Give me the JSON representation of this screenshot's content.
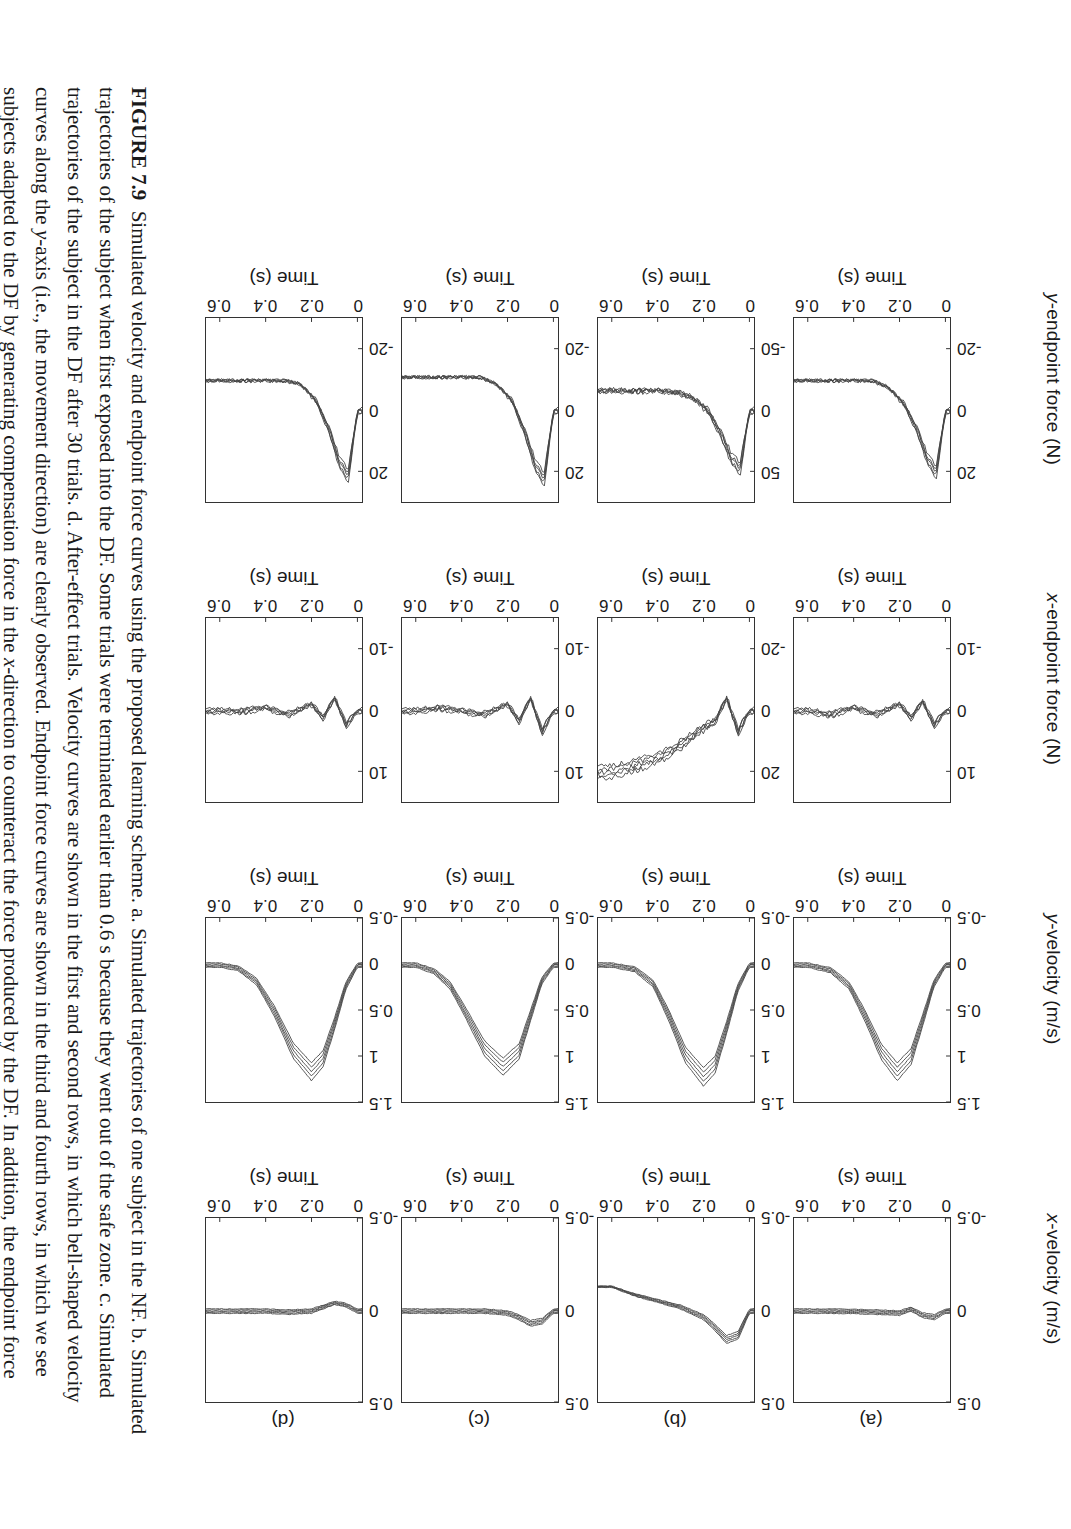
{
  "figure": {
    "id": "FIGURE 7.9",
    "panel_labels": [
      "(a)",
      "(b)",
      "(c)",
      "(d)"
    ],
    "x_axis": {
      "title": "Time (s)",
      "ticks": [
        "0",
        "0.2",
        "0.4",
        "0.6"
      ],
      "tickvals": [
        0,
        0.2,
        0.4,
        0.6
      ],
      "range": [
        -0.02,
        0.66
      ]
    },
    "rows": [
      {
        "title": "x-velocity (m/s)",
        "title_italic_prefix": "x",
        "title_rest": "-velocity (m/s)",
        "yticks": [
          "0.5",
          "0",
          "-0.5"
        ],
        "ytickvals": [
          0.5,
          0,
          -0.5
        ],
        "ylim": [
          -0.5,
          0.5
        ]
      },
      {
        "title": "y-velocity (m/s)",
        "title_italic_prefix": "y",
        "title_rest": "-velocity (m/s)",
        "yticks": [
          "1.5",
          "1",
          "0.5",
          "0",
          "-0.5"
        ],
        "ytickvals": [
          1.5,
          1,
          0.5,
          0,
          -0.5
        ],
        "ylim": [
          -0.5,
          1.5
        ]
      },
      {
        "title": "x-endpoint force (N)",
        "title_italic_prefix": "x",
        "title_rest": "-endpoint force (N)",
        "yticks": [
          "10",
          "0",
          "-10"
        ],
        "ytickvals": [
          10,
          0,
          -10
        ],
        "ylim": [
          -15,
          15
        ]
      },
      {
        "title": "y-endpoint force (N)",
        "title_italic_prefix": "y",
        "title_rest": "-endpoint force (N)",
        "yticks": [
          "20",
          "0",
          "-20"
        ],
        "ytickvals": [
          20,
          0,
          -20
        ],
        "ylim": [
          -30,
          30
        ]
      }
    ],
    "column_overrides": [
      {
        "col": 1,
        "row": 2,
        "yticks": [
          "20",
          "0",
          "-20"
        ],
        "ytickvals": [
          20,
          0,
          -20
        ],
        "ylim": [
          -30,
          30
        ]
      },
      {
        "col": 1,
        "row": 3,
        "yticks": [
          "50",
          "0",
          "-50"
        ],
        "ytickvals": [
          50,
          0,
          -50
        ],
        "ylim": [
          -75,
          75
        ]
      }
    ]
  },
  "chart_data": {
    "type": "line",
    "title": "Simulated velocity and endpoint force curves",
    "xlabel": "Time (s)",
    "grid": false,
    "legend": "none",
    "n_traces_per_panel": 5,
    "panels": [
      {
        "panel": "(a)",
        "row": "x-velocity (m/s)",
        "ylabel": "x-velocity (m/s)",
        "ylim": [
          -0.5,
          0.5
        ],
        "xlim": [
          0,
          0.66
        ],
        "description": "Near-zero lateral velocity, small ripple peaking ~0.03 m/s near t=0.12 s",
        "x": [
          0,
          0.05,
          0.1,
          0.15,
          0.2,
          0.3,
          0.4,
          0.5,
          0.6
        ],
        "y": [
          0,
          0.03,
          0.02,
          -0.01,
          0.01,
          0.005,
          0.002,
          0,
          0
        ]
      },
      {
        "panel": "(b)",
        "row": "x-velocity (m/s)",
        "ylabel": "x-velocity (m/s)",
        "ylim": [
          -0.5,
          0.5
        ],
        "xlim": [
          0,
          0.66
        ],
        "description": "Large lateral deviation early, traces fan out and some terminate before 0.6 s",
        "x": [
          0,
          0.05,
          0.1,
          0.15,
          0.2,
          0.3,
          0.4,
          0.5,
          0.6
        ],
        "y": [
          0,
          0.12,
          0.14,
          0.08,
          0.03,
          -0.02,
          -0.05,
          -0.08,
          -0.12
        ]
      },
      {
        "panel": "(c)",
        "row": "x-velocity (m/s)",
        "ylabel": "x-velocity (m/s)",
        "ylim": [
          -0.5,
          0.5
        ],
        "xlim": [
          0,
          0.66
        ],
        "description": "Reduced lateral deviation after adaptation",
        "x": [
          0,
          0.05,
          0.1,
          0.15,
          0.2,
          0.3,
          0.4,
          0.5,
          0.6
        ],
        "y": [
          0,
          0.05,
          0.06,
          0.03,
          0.01,
          0,
          0,
          0,
          0
        ]
      },
      {
        "panel": "(d)",
        "row": "x-velocity (m/s)",
        "ylabel": "x-velocity (m/s)",
        "ylim": [
          -0.5,
          0.5
        ],
        "xlim": [
          0,
          0.66
        ],
        "description": "After-effect: small mirrored lateral deviation",
        "x": [
          0,
          0.05,
          0.1,
          0.15,
          0.2,
          0.3,
          0.4,
          0.5,
          0.6
        ],
        "y": [
          0,
          -0.03,
          -0.04,
          -0.02,
          0,
          0.005,
          0,
          0,
          0
        ]
      },
      {
        "panel": "(a)",
        "row": "y-velocity (m/s)",
        "ylabel": "y-velocity (m/s)",
        "ylim": [
          -0.5,
          1.5
        ],
        "xlim": [
          0,
          0.66
        ],
        "description": "Bell-shaped velocity profile peaking ~1.05 m/s at t≈0.21 s",
        "x": [
          0,
          0.05,
          0.1,
          0.15,
          0.21,
          0.28,
          0.35,
          0.42,
          0.5,
          0.6
        ],
        "y": [
          0,
          0.18,
          0.55,
          0.9,
          1.05,
          0.85,
          0.5,
          0.2,
          0.05,
          0.0
        ]
      },
      {
        "panel": "(b)",
        "row": "y-velocity (m/s)",
        "ylabel": "y-velocity (m/s)",
        "ylim": [
          -0.5,
          1.5
        ],
        "xlim": [
          0,
          0.66
        ],
        "description": "Bell-shaped profile, peak ~1.1 m/s at t≈0.2 s with more trial spread",
        "x": [
          0,
          0.05,
          0.1,
          0.15,
          0.2,
          0.28,
          0.35,
          0.42,
          0.5,
          0.6
        ],
        "y": [
          0,
          0.22,
          0.62,
          0.98,
          1.1,
          0.88,
          0.5,
          0.18,
          0.04,
          0.0
        ]
      },
      {
        "panel": "(c)",
        "row": "y-velocity (m/s)",
        "ylabel": "y-velocity (m/s)",
        "ylim": [
          -0.5,
          1.5
        ],
        "xlim": [
          0,
          0.66
        ],
        "description": "Bell-shaped profile, peak ~1.0 m/s at t≈0.22 s",
        "x": [
          0,
          0.05,
          0.1,
          0.15,
          0.22,
          0.3,
          0.38,
          0.45,
          0.52,
          0.6
        ],
        "y": [
          0,
          0.15,
          0.5,
          0.85,
          1.0,
          0.82,
          0.48,
          0.2,
          0.06,
          0.0
        ]
      },
      {
        "panel": "(d)",
        "row": "y-velocity (m/s)",
        "ylabel": "y-velocity (m/s)",
        "ylim": [
          -0.5,
          1.5
        ],
        "xlim": [
          0,
          0.66
        ],
        "description": "Bell-shaped profile, peak ~1.05 m/s at t≈0.2 s",
        "x": [
          0,
          0.05,
          0.1,
          0.15,
          0.2,
          0.28,
          0.36,
          0.44,
          0.52,
          0.6
        ],
        "y": [
          0,
          0.2,
          0.58,
          0.92,
          1.05,
          0.84,
          0.46,
          0.16,
          0.03,
          0.0
        ]
      },
      {
        "panel": "(a)",
        "row": "x-endpoint force (N)",
        "ylabel": "x-endpoint force (N)",
        "ylim": [
          -15,
          15
        ],
        "xlim": [
          0,
          0.66
        ],
        "description": "Noisy lateral force around 0 N, amplitude under ~5 N",
        "x": [
          0,
          0.05,
          0.1,
          0.15,
          0.2,
          0.3,
          0.4,
          0.5,
          0.6
        ],
        "y": [
          0,
          2,
          -1.5,
          1,
          -1,
          0.5,
          -0.5,
          0.5,
          0
        ]
      },
      {
        "panel": "(b)",
        "row": "x-endpoint force (N)",
        "ylabel": "x-endpoint force (N)",
        "ylim": [
          -30,
          30
        ],
        "xlim": [
          0,
          0.66
        ],
        "description": "Large noisy lateral forces, excursions beyond 20 N late in trial",
        "x": [
          0,
          0.05,
          0.1,
          0.15,
          0.2,
          0.3,
          0.4,
          0.5,
          0.6
        ],
        "y": [
          0,
          6,
          -4,
          3,
          5,
          10,
          14,
          16,
          18
        ]
      },
      {
        "panel": "(c)",
        "row": "x-endpoint force (N)",
        "ylabel": "x-endpoint force (N)",
        "ylim": [
          -15,
          15
        ],
        "xlim": [
          0,
          0.66
        ],
        "description": "Noisy lateral force near 0 N with small transient at onset",
        "x": [
          0,
          0.05,
          0.1,
          0.15,
          0.2,
          0.3,
          0.4,
          0.5,
          0.6
        ],
        "y": [
          0,
          3,
          -2,
          1.5,
          -1,
          0.5,
          0,
          -0.5,
          0
        ]
      },
      {
        "panel": "(d)",
        "row": "x-endpoint force (N)",
        "ylabel": "x-endpoint force (N)",
        "ylim": [
          -15,
          15
        ],
        "xlim": [
          0,
          0.66
        ],
        "description": "Noisy lateral force near 0 N",
        "x": [
          0,
          0.05,
          0.1,
          0.15,
          0.2,
          0.3,
          0.4,
          0.5,
          0.6
        ],
        "y": [
          0,
          2,
          -2,
          1,
          -1,
          0.5,
          -0.5,
          0,
          0
        ]
      },
      {
        "panel": "(a)",
        "row": "y-endpoint force (N)",
        "ylabel": "y-endpoint force (N)",
        "ylim": [
          -30,
          30
        ],
        "xlim": [
          0,
          0.66
        ],
        "description": "Forward force rises to ~20 N then decays toward -8 N plateau",
        "x": [
          0,
          0.04,
          0.08,
          0.12,
          0.18,
          0.25,
          0.32,
          0.4,
          0.5,
          0.6
        ],
        "y": [
          0,
          18,
          14,
          6,
          -2,
          -7,
          -9,
          -9,
          -9,
          -9
        ]
      },
      {
        "panel": "(b)",
        "row": "y-endpoint force (N)",
        "ylabel": "y-endpoint force (N)",
        "ylim": [
          -75,
          75
        ],
        "xlim": [
          0,
          0.66
        ],
        "description": "Large forward force ~45 N at onset decaying to ~-15 N plateau",
        "x": [
          0,
          0.04,
          0.08,
          0.12,
          0.18,
          0.25,
          0.32,
          0.4,
          0.5,
          0.6
        ],
        "y": [
          0,
          42,
          35,
          18,
          0,
          -10,
          -14,
          -15,
          -15,
          -15
        ]
      },
      {
        "panel": "(c)",
        "row": "y-endpoint force (N)",
        "ylabel": "y-endpoint force (N)",
        "ylim": [
          -30,
          30
        ],
        "xlim": [
          0,
          0.66
        ],
        "description": "Forward force ~22 N at onset decaying to ~-10 N plateau",
        "x": [
          0,
          0.04,
          0.08,
          0.12,
          0.18,
          0.25,
          0.32,
          0.4,
          0.5,
          0.6
        ],
        "y": [
          0,
          20,
          16,
          7,
          -3,
          -8,
          -10,
          -10,
          -10,
          -10
        ]
      },
      {
        "panel": "(d)",
        "row": "y-endpoint force (N)",
        "ylabel": "y-endpoint force (N)",
        "ylim": [
          -30,
          30
        ],
        "xlim": [
          0,
          0.66
        ],
        "description": "Forward force ~20 N at onset decaying to ~-9 N plateau",
        "x": [
          0,
          0.04,
          0.08,
          0.12,
          0.18,
          0.25,
          0.32,
          0.4,
          0.5,
          0.6
        ],
        "y": [
          0,
          19,
          15,
          6,
          -3,
          -8,
          -9,
          -9,
          -9,
          -9
        ]
      }
    ]
  },
  "caption": {
    "label": "FIGURE 7.9",
    "text": "Simulated velocity and endpoint force curves using the proposed learning scheme. a. Simulated trajectories of one subject in the NF. b. Simulated trajectories of the subject when first exposed into the DF. Some trials were terminated earlier than 0.6 s because they went out of the safe zone. c. Simulated trajectories of the subject in the DF after 30 trials. d. After-effect trials. Velocity curves are shown in the first and second rows, in which bell-shaped velocity curves along the y-axis (i.e., the movement direction) are clearly observed. Endpoint force curves are shown in the third and fourth rows, in which we see subjects adapted to the DF by generating compensation force in the x-direction to counteract the force produced by the DF. In addition, the endpoint force"
  }
}
